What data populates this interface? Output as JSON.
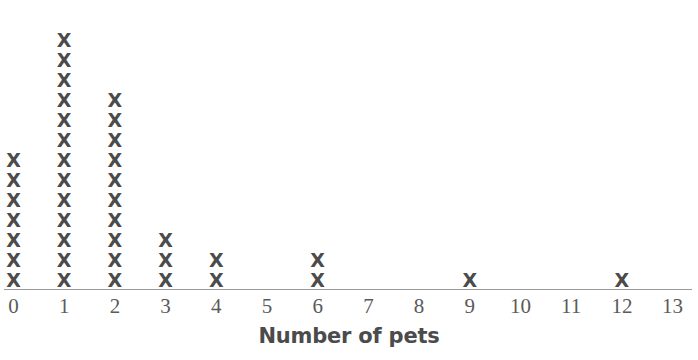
{
  "chart_data": {
    "type": "bar",
    "plot_style": "dot-plot",
    "title": "",
    "subtitle": "",
    "xlabel": "Number of pets",
    "ylabel": "",
    "categories": [
      "0",
      "1",
      "2",
      "3",
      "4",
      "5",
      "6",
      "7",
      "8",
      "9",
      "10",
      "11",
      "12",
      "13"
    ],
    "values": [
      7,
      13,
      10,
      3,
      2,
      0,
      2,
      0,
      0,
      1,
      0,
      0,
      1,
      0
    ],
    "mark": "X",
    "xlim": [
      0,
      13
    ],
    "ylim": [
      0,
      13
    ],
    "grid": false,
    "legend": null,
    "annotations": [],
    "total_count": 39
  },
  "chart": {
    "axis_title": "Number of pets",
    "mark_glyph": "X",
    "mark_color": "#4b4b4b",
    "axis_line_color": "#9a9a9a",
    "tick_label_color": "#5a5a5a",
    "background": "#ffffff",
    "tick_labels": [
      "0",
      "1",
      "2",
      "3",
      "4",
      "5",
      "6",
      "7",
      "8",
      "9",
      "10",
      "11",
      "12",
      "13"
    ],
    "counts": [
      7,
      13,
      10,
      3,
      2,
      0,
      2,
      0,
      0,
      1,
      0,
      0,
      1,
      0
    ]
  }
}
